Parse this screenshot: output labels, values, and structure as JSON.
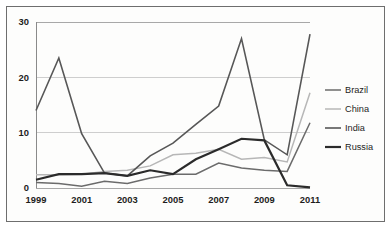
{
  "chart_data": {
    "type": "line",
    "title": "",
    "subtitle": "",
    "xlabel": "",
    "ylabel": "",
    "x": [
      1999,
      2000,
      2001,
      2002,
      2003,
      2004,
      2005,
      2006,
      2007,
      2008,
      2009,
      2010,
      2011
    ],
    "categories": [
      "1999",
      "2000",
      "2001",
      "2002",
      "2003",
      "2004",
      "2005",
      "2006",
      "2007",
      "2008",
      "2009",
      "2010",
      "2011"
    ],
    "xtick_labels": [
      "1999",
      "2001",
      "2003",
      "2005",
      "2007",
      "2009",
      "2011"
    ],
    "xtick_values": [
      1999,
      2001,
      2003,
      2005,
      2007,
      2009,
      2011
    ],
    "ytick_labels": [
      "0",
      "10",
      "20",
      "30"
    ],
    "ytick_values": [
      0,
      10,
      20,
      30
    ],
    "xlim": [
      1999,
      2011
    ],
    "ylim": [
      0,
      30
    ],
    "grid": true,
    "grid_axis": "y",
    "legend_position": "right",
    "series": [
      {
        "name": "Brazil",
        "color": "#6b6b6b",
        "width": 1.5,
        "values": [
          1.0,
          0.8,
          0.3,
          1.2,
          0.8,
          1.8,
          2.5,
          2.5,
          4.5,
          3.6,
          3.2,
          3.0,
          11.8
        ]
      },
      {
        "name": "China",
        "color": "#b7b7b7",
        "width": 1.5,
        "values": [
          2.4,
          2.4,
          2.5,
          3.0,
          3.2,
          4.0,
          6.0,
          6.3,
          7.0,
          5.2,
          5.5,
          4.7,
          17.2
        ]
      },
      {
        "name": "India",
        "color": "#575757",
        "width": 1.6,
        "values": [
          14.0,
          23.5,
          9.8,
          2.7,
          2.2,
          5.8,
          8.1,
          11.5,
          14.8,
          27.0,
          8.7,
          6.0,
          27.8
        ]
      },
      {
        "name": "Russia",
        "color": "#2b2b2b",
        "width": 2.2,
        "values": [
          1.5,
          2.5,
          2.5,
          2.7,
          2.2,
          3.2,
          2.5,
          5.2,
          7.0,
          8.9,
          8.6,
          0.5,
          0.1
        ]
      }
    ]
  },
  "legend": {
    "entries": [
      "Brazil",
      "China",
      "India",
      "Russia"
    ]
  },
  "colors": {
    "frame_border": "#6e6e6e",
    "gridline": "#c9c9c9",
    "axis": "#8a8a8a",
    "background": "#fdfdfc",
    "text": "#1d1d1d"
  }
}
